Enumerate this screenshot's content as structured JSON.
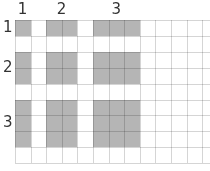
{
  "figure": {
    "column_labels": [
      "1",
      "2",
      "3"
    ],
    "row_labels": [
      "1",
      "2",
      "3"
    ],
    "grid": {
      "columns": 12,
      "rows": 9,
      "cell_width": 15.6,
      "cell_height": 15.9,
      "origin_x": 15,
      "origin_y": 20
    },
    "column_groups": [
      {
        "label": "1",
        "start_col": 0,
        "span": 1
      },
      {
        "label": "2",
        "start_col": 2,
        "span": 2
      },
      {
        "label": "3",
        "start_col": 5,
        "span": 3
      }
    ],
    "row_groups": [
      {
        "label": "1",
        "start_row": 0,
        "span": 1
      },
      {
        "label": "2",
        "start_row": 2,
        "span": 2
      },
      {
        "label": "3",
        "start_row": 5,
        "span": 3
      }
    ],
    "colors": {
      "shade": "#b5b5b5",
      "gridline": "#d5d5d5",
      "gridline_on_shade": "#a9a9a9",
      "label": "#333333",
      "background": "#ffffff"
    }
  }
}
